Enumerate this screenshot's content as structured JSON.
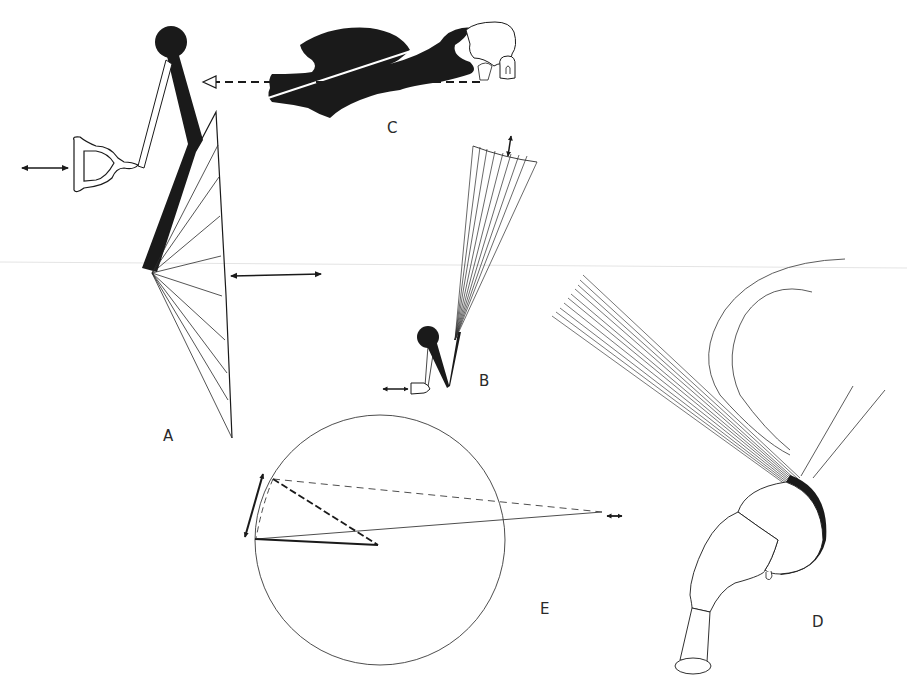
{
  "figure": {
    "width": 907,
    "height": 691,
    "background": "#ffffff",
    "ink_color": "#1a1a1a",
    "fine_line_color": "#3a3a3a"
  },
  "panels": [
    {
      "id": "A",
      "label": "A",
      "description": "Lever arm with ball, pennant-shaped reed (D-shaped), and a fan of lines forming a triangle; horizontal double-headed arrows"
    },
    {
      "id": "B",
      "label": "B",
      "description": "Small version of the lever with ball and tiny reed, with a long narrow fan of lines ending in a curved arc and a vertical double-headed arrow"
    },
    {
      "id": "C",
      "label": "C",
      "description": "Black silhouette of a horizontal structure with white line, dashed arrow pointing left toward panel A's ball"
    },
    {
      "id": "D",
      "label": "D",
      "description": "Bulbous stalked organ with a tuft of many fine straight hairs and long curved hairs emerging from a darkened rim"
    },
    {
      "id": "E",
      "label": "E",
      "description": "Large circle with a triangle inside; dashed and solid lines converging to a distant point with a small double-headed arrow; curved double-headed arrow on left rim"
    }
  ],
  "labels": {
    "A": "A",
    "B": "B",
    "C": "C",
    "D": "D",
    "E": "E"
  }
}
